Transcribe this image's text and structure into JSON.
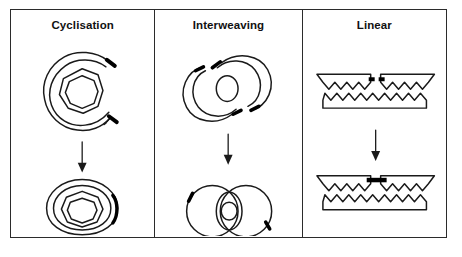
{
  "figure": {
    "type": "scientific-diagram",
    "border_color": "#2b2b2b",
    "stroke_color": "#1a1a1a",
    "accent_color": "#000000",
    "background": "#ffffff",
    "panels": [
      {
        "id": "cyclisation",
        "title": "Cyclisation",
        "before_label": "open C-shaped coiled duplex with cohesive ends",
        "arrow_label": "transition-arrow",
        "after_label": "closed circular duplex with sealed junction"
      },
      {
        "id": "interweaving",
        "title": "Interweaving",
        "before_label": "two separate open circular arcs with free ends",
        "arrow_label": "transition-arrow",
        "after_label": "two interlocked closed circles forming a catenane"
      },
      {
        "id": "linear",
        "title": "Linear",
        "before_label": "two linear duplex fragments with complementary zigzag overhangs",
        "arrow_label": "transition-arrow",
        "after_label": "single ligated linear duplex with sealed nick"
      }
    ]
  }
}
